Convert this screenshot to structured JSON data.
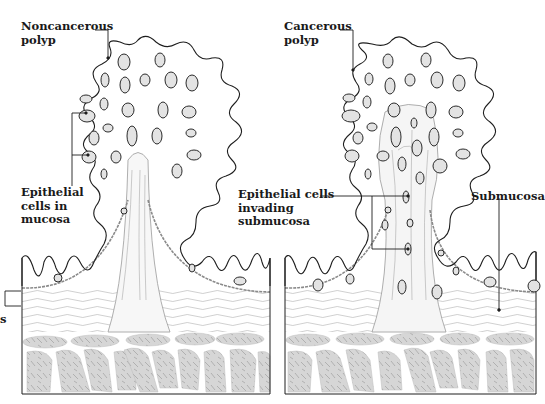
{
  "figure": {
    "left_panel": {
      "name": "noncancerous-polyp-panel",
      "title_lines": [
        "Noncancerous",
        "polyp"
      ],
      "epithelial_label_lines": [
        "Epithelial",
        "cells in",
        "mucosa"
      ],
      "partial_left_label": "s"
    },
    "right_panel": {
      "name": "cancerous-polyp-panel",
      "title_lines": [
        "Cancerous",
        "polyp"
      ],
      "invading_label_lines": [
        "Epithelial cells",
        "invading",
        "submucosa"
      ],
      "submucosa_label": "Submucosa"
    },
    "colors": {
      "outline": "#1e1e1e",
      "cell_fill": "#e3e3e3",
      "muscle_fill": "#d4d4d4",
      "fiber_stroke": "#9a9a9a",
      "background": "#ffffff"
    }
  }
}
